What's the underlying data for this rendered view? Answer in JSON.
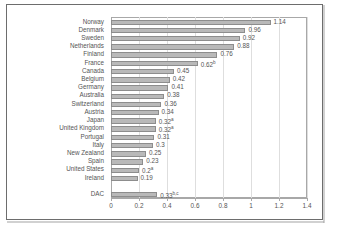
{
  "chart_data": {
    "type": "bar",
    "orientation": "horizontal",
    "title": "",
    "subtitle": "",
    "xlabel": "",
    "ylabel": "",
    "xlim": [
      0,
      1.4
    ],
    "grid": true,
    "legend": null,
    "legend_position": "none",
    "categories": [
      "Norway",
      "Denmark",
      "Sweden",
      "Netherlands",
      "Finland",
      "France",
      "Canada",
      "Belgium",
      "Germany",
      "Australia",
      "Switzerland",
      "Austria",
      "Japan",
      "United Kingdom",
      "Portugal",
      "Italy",
      "New Zealand",
      "Spain",
      "United States",
      "Ireland",
      "DAC"
    ],
    "values": [
      1.14,
      0.96,
      0.92,
      0.88,
      0.76,
      0.62,
      0.45,
      0.42,
      0.41,
      0.38,
      0.36,
      0.34,
      0.32,
      0.32,
      0.31,
      0.3,
      0.25,
      0.23,
      0.2,
      0.19,
      0.33
    ],
    "data_labels": [
      "1.14",
      "0.96",
      "0.92",
      "0.88",
      "0.76",
      "0.62",
      "0.45",
      "0.42",
      "0.41",
      "0.38",
      "0.36",
      "0.34",
      "0.32",
      "0.32",
      "0.31",
      "0.3",
      "0.25",
      "0.23",
      "0.2",
      "0.19",
      "0.33"
    ],
    "label_footnotes": [
      "",
      "",
      "",
      "",
      "",
      "b",
      "",
      "",
      "",
      "",
      "",
      "",
      "a",
      "a",
      "",
      "",
      "",
      "",
      "a",
      "",
      "b,c"
    ],
    "xticks": [
      0,
      0.2,
      0.4,
      0.6,
      0.8,
      1,
      1.2,
      1.4
    ],
    "xticklabels": [
      "0",
      "0.2",
      "0.4",
      "0.6",
      "0.8",
      "1",
      "1.2",
      "1.4"
    ],
    "separator_before_index": 20,
    "bar_color": "#b9b9b9",
    "bar_border_color": "#8d8d8d",
    "grid_color": "#dedede",
    "axis_color": "#a8a8a8",
    "text_color": "#555555",
    "plot_background": "#ffffff",
    "frame_border_color": "#6d6d6d"
  }
}
